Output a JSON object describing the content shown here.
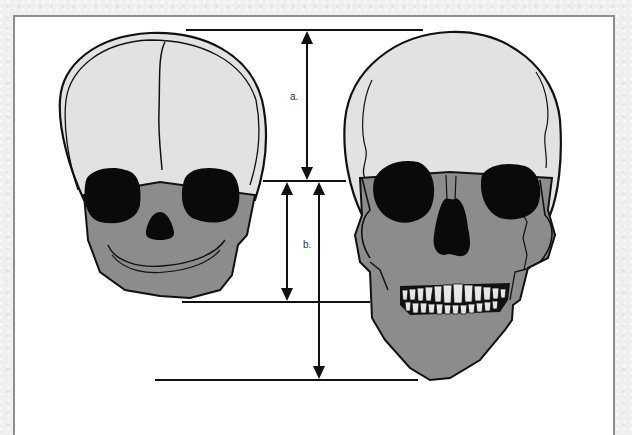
{
  "diagram": {
    "title": "",
    "subjects": [
      {
        "id": "infant-skull",
        "label": "Infant skull (frontal view)"
      },
      {
        "id": "adult-skull",
        "label": "Adult skull (frontal view)"
      }
    ],
    "measurements": [
      {
        "id": "a",
        "label": "a.",
        "description": "cranial vault height (top of skull to orbit line)"
      },
      {
        "id": "b",
        "label": "b.",
        "description": "infant facial height (orbit line to infant chin)"
      },
      {
        "id": "c",
        "label": "",
        "description": "adult facial height (orbit line to adult chin)"
      }
    ],
    "colors": {
      "cranium": "#e2e2e2",
      "face": "#8c8c8c",
      "cavity": "#0a0a0a",
      "teeth": "#e6e6e6",
      "line": "#111111",
      "frame_border": "#8e8e8e",
      "background": "#efefef"
    }
  }
}
